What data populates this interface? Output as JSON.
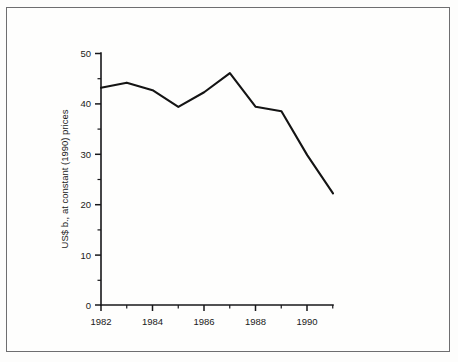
{
  "figure": {
    "background_color": "#fdfdfc",
    "frame_color": "#6e6e70",
    "line_color": "#141414"
  },
  "chart_data": {
    "type": "line",
    "title": "",
    "subtitle": "",
    "xlabel": "",
    "ylabel": "US$ b., at constant (1990) prices",
    "x": [
      1982,
      1983,
      1984,
      1985,
      1986,
      1987,
      1988,
      1989,
      1990,
      1991
    ],
    "values": [
      43.2,
      44.2,
      42.7,
      39.4,
      42.3,
      46.1,
      39.4,
      38.5,
      29.8,
      22.2
    ],
    "series": [
      {
        "name": "US$ b., at constant (1990) prices",
        "values": [
          43.2,
          44.2,
          42.7,
          39.4,
          42.3,
          46.1,
          39.4,
          38.5,
          29.8,
          22.2
        ]
      }
    ],
    "xlim": [
      1982,
      1991
    ],
    "ylim": [
      0,
      50
    ],
    "x_tick_labels": [
      "1982",
      "1984",
      "1986",
      "1988",
      "1990"
    ],
    "x_tick_values": [
      1982,
      1984,
      1986,
      1988,
      1990
    ],
    "x_minor_tick_values": [
      1983,
      1985,
      1987,
      1989,
      1991
    ],
    "y_tick_labels": [
      "0",
      "10",
      "20",
      "30",
      "40",
      "50"
    ],
    "y_tick_values": [
      0,
      10,
      20,
      30,
      40,
      50
    ],
    "y_minor_tick_values": [
      5,
      15,
      25,
      35,
      45
    ],
    "grid": false,
    "legend": false,
    "legend_position": "none"
  }
}
